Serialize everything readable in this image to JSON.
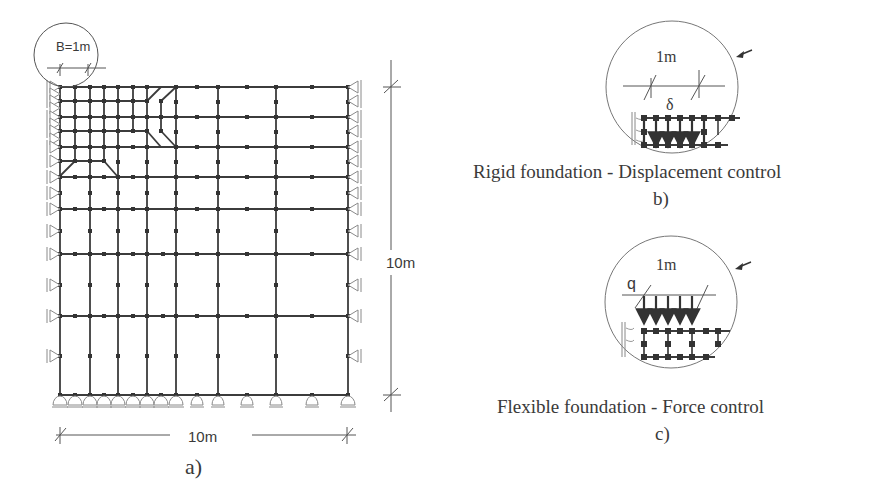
{
  "figure": {
    "panel_a": {
      "label": "a)",
      "detail_label": "B=1m",
      "width_dimension": "10m",
      "height_dimension": "10m"
    },
    "panel_b": {
      "label": "b)",
      "caption": "Rigid foundation - Displacement control",
      "span_label": "1m",
      "load_symbol": "δ"
    },
    "panel_c": {
      "label": "c)",
      "caption": "Flexible foundation - Force control",
      "span_label": "1m",
      "load_symbol": "q"
    },
    "colors": {
      "line": "#3c3c3c",
      "support": "#8a8a8a",
      "text": "#3a3a3a"
    }
  }
}
